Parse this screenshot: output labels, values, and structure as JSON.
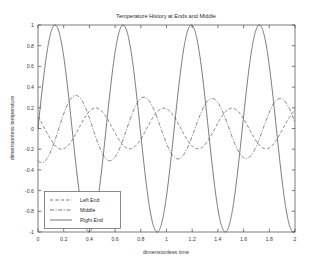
{
  "figure": {
    "name": "temperature-history-figure",
    "background": "#ffffff",
    "line_color": "#4a4a4a",
    "axis_color": "#5a5a5a"
  },
  "chart_data": {
    "type": "line",
    "title": "Temperature History at Ends and Middle",
    "xlabel": "dimensionless time",
    "ylabel": "dimensionless temperature",
    "xlim": [
      0,
      2
    ],
    "ylim": [
      -1,
      1
    ],
    "xticks": [
      0,
      0.2,
      0.4,
      0.6,
      0.8,
      1,
      1.2,
      1.4,
      1.6,
      1.8,
      2
    ],
    "xticklabels": [
      "0",
      "0.2",
      "0.4",
      "0.6",
      "0.8",
      "1",
      "1.2",
      "1.4",
      "1.6",
      "1.8",
      "2"
    ],
    "yticks": [
      -1,
      -0.8,
      -0.6,
      -0.4,
      -0.2,
      0,
      0.2,
      0.4,
      0.6,
      0.8,
      1
    ],
    "yticklabels": [
      "-1",
      "-0.8",
      "-0.6",
      "-0.4",
      "-0.2",
      "0",
      "0.2",
      "0.4",
      "0.6",
      "0.8",
      "1"
    ],
    "grid": false,
    "legend_position": "lower left",
    "series": [
      {
        "name": "Left End",
        "linestyle": "dashed",
        "dasharray": "3.2,2.2",
        "amplitude": 0.2,
        "period": 0.53,
        "phase_deg": 215,
        "offset": 0.0,
        "comment": "small amplitude lagging wave, peaks ~0.2, troughs ~-0.18"
      },
      {
        "name": "Middle",
        "linestyle": "dashdot",
        "dasharray": "4,1.6,1,1.6",
        "amplitude": 0.33,
        "period": 0.53,
        "phase_deg": 110,
        "offset": 0.0,
        "comment": "intermediate amplitude, first peak ~0.37 near t=0.2, later peaks ~0.30"
      },
      {
        "name": "Right End",
        "linestyle": "solid",
        "dasharray": "none",
        "amplitude": 1.0,
        "period": 0.53,
        "phase_deg": 0,
        "offset": 0.0,
        "comment": "driving boundary sine wave, full amplitude 1, peaks t=0.11,0.64,1.17,1.70"
      }
    ],
    "sampled_points": {
      "x": [
        0,
        0.1,
        0.2,
        0.3,
        0.4,
        0.5,
        0.6,
        0.7,
        0.8,
        0.9,
        1.0,
        1.1,
        1.2,
        1.3,
        1.4,
        1.5,
        1.6,
        1.7,
        1.8,
        1.9,
        2.0
      ],
      "Right End": [
        0,
        0.99,
        0.31,
        -0.86,
        -0.71,
        0.54,
        0.94,
        -0.09,
        -1.0,
        -0.39,
        0.81,
        0.78,
        -0.45,
        -0.97,
        0.02,
        0.99,
        0.47,
        -0.74,
        -0.84,
        0.35,
        1.0
      ],
      "Middle": [
        0.02,
        0.28,
        0.37,
        0.23,
        -0.08,
        -0.2,
        -0.09,
        0.18,
        0.3,
        0.22,
        -0.04,
        -0.2,
        -0.13,
        0.12,
        0.29,
        0.25,
        0.0,
        -0.18,
        -0.16,
        0.07,
        0.27
      ],
      "Left End": [
        0.0,
        0.08,
        0.14,
        0.2,
        0.12,
        -0.06,
        -0.18,
        -0.15,
        0.0,
        0.14,
        0.19,
        0.08,
        -0.1,
        -0.18,
        -0.12,
        0.04,
        0.16,
        0.18,
        0.05,
        -0.12,
        -0.18
      ]
    }
  },
  "legend": {
    "items": [
      {
        "label": "Left End"
      },
      {
        "label": "Middle"
      },
      {
        "label": "Right End"
      }
    ]
  }
}
